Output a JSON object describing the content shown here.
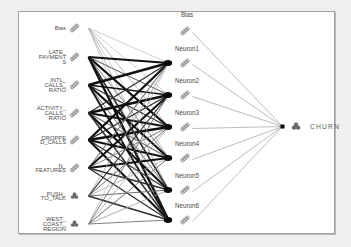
{
  "window": {
    "background": "#efefef"
  },
  "frame": {
    "fill": "#ffffff",
    "border_color": "#a2a2a2"
  },
  "diagram_type": "neural-network",
  "colors": {
    "label_text": "#4e4e4e",
    "hidden_label_text": "#474747",
    "output_label_text": "#5a5a5a",
    "node_blob": "#0a0a0a",
    "hidden_output_edge": "#8e8e8e",
    "edge_heavy": "#101010",
    "edge_dark": "#2f2f2f",
    "edge_mid": "#6f6f6f",
    "edge_light": "#9a9a9a",
    "edge_faint": "#aeaeae",
    "pencil_fill": "#c6c6c6",
    "pencil_stroke": "#787878",
    "pencil_stripe": "#6b6b6b",
    "dots_fill": "#6e6e6e",
    "dots_stroke": "#4a4a4a"
  },
  "network": {
    "input_layer": [
      {
        "id": "bias",
        "label_lines": [
          "Bias"
        ],
        "icon": "pencil-icon",
        "y": 28
      },
      {
        "id": "late_payments",
        "label_lines": [
          "LATE_",
          "PAYMENT",
          "S"
        ],
        "icon": "pencil-icon",
        "y": 57
      },
      {
        "id": "intl_calls_ratio",
        "label_lines": [
          "INTL_",
          "CALLS_",
          "RATIO"
        ],
        "icon": "pencil-icon",
        "y": 85
      },
      {
        "id": "activity_calls_ratio",
        "label_lines": [
          "ACTIVITY_",
          "CALLS_",
          "RATIO"
        ],
        "icon": "pencil-icon",
        "y": 113
      },
      {
        "id": "dropped_calls",
        "label_lines": [
          "DROPPE",
          "D_CALLS"
        ],
        "icon": "pencil-icon",
        "y": 140
      },
      {
        "id": "n_features",
        "label_lines": [
          "N_",
          "FEATURES"
        ],
        "icon": "pencil-icon",
        "y": 168
      },
      {
        "id": "push_to_talk",
        "label_lines": [
          "PUSH_",
          "TO_TALK"
        ],
        "icon": "dots-icon",
        "y": 196
      },
      {
        "id": "west_coast_region",
        "label_lines": [
          "WEST_",
          "COAST_",
          "REGION"
        ],
        "icon": "dots-icon",
        "y": 224
      }
    ],
    "hidden_layer": [
      {
        "id": "hidden_bias",
        "label": "Bias",
        "icon": "pencil-icon",
        "y": 31,
        "label_y": 17,
        "is_bias": true
      },
      {
        "id": "neuron1",
        "label": "Neuron1",
        "icon": "pencil-icon",
        "y": 63,
        "label_y": 51,
        "is_bias": false
      },
      {
        "id": "neuron2",
        "label": "Neuron2",
        "icon": "pencil-icon",
        "y": 95,
        "label_y": 83,
        "is_bias": false
      },
      {
        "id": "neuron3",
        "label": "Neuron3",
        "icon": "pencil-icon",
        "y": 127,
        "label_y": 115,
        "is_bias": false
      },
      {
        "id": "neuron4",
        "label": "Neuron4",
        "icon": "pencil-icon",
        "y": 158,
        "label_y": 146,
        "is_bias": false
      },
      {
        "id": "neuron5",
        "label": "Neuron5",
        "icon": "pencil-icon",
        "y": 190,
        "label_y": 178,
        "is_bias": false
      },
      {
        "id": "neuron6",
        "label": "Neuron6",
        "icon": "pencil-icon",
        "y": 220,
        "label_y": 208,
        "is_bias": false
      }
    ],
    "output_layer": {
      "id": "churn",
      "label": "CHURN",
      "icon": "dots-icon",
      "y": 126.5
    },
    "edges": {
      "input_to_hidden_widths": [
        [
          0.6,
          0.6,
          0.7,
          0.6,
          0.7,
          0.6
        ],
        [
          1.9,
          1.1,
          2.3,
          0.9,
          1.6,
          2.4
        ],
        [
          2.4,
          1.7,
          1.2,
          2.2,
          1.0,
          1.8
        ],
        [
          1.3,
          2.5,
          1.8,
          1.1,
          2.2,
          1.5
        ],
        [
          2.2,
          1.4,
          2.4,
          1.8,
          1.2,
          2.0
        ],
        [
          1.1,
          1.9,
          0.9,
          2.1,
          1.6,
          1.3
        ],
        [
          0.8,
          1.2,
          1.0,
          0.7,
          1.1,
          1.5
        ],
        [
          0.6,
          0.9,
          0.7,
          1.0,
          0.8,
          0.9
        ]
      ],
      "hidden_to_output_width": 0.6
    }
  },
  "layout": {
    "input_fan_x": 88.5,
    "input_label_right_x": 66,
    "input_icon_x": 74.5,
    "hidden_blob_x": 168.5,
    "hidden_icon_x": 185,
    "hidden_out_x": 192.5,
    "hidden_label_cx": 187,
    "output_point_x": 282.5,
    "output_icon_x": 296,
    "output_label_x": 310,
    "output_label_baseline": 129
  }
}
